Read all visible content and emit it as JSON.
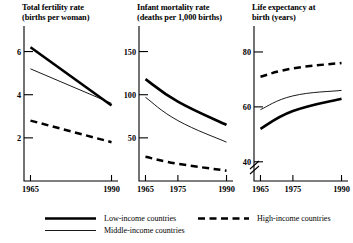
{
  "chart_data": [
    {
      "type": "line",
      "title": "Total fertility rate\n(births per woman)",
      "xlabel": "",
      "ylabel": "",
      "x": [
        1965,
        1990
      ],
      "xticks": [
        "1965",
        "1990"
      ],
      "xtick_values": [
        1965,
        1990
      ],
      "xlim": [
        1963,
        1992
      ],
      "yticks": [
        "2",
        "4",
        "6"
      ],
      "ytick_values": [
        2,
        4,
        6
      ],
      "ylim": [
        0,
        7
      ],
      "grid": false,
      "axis_break": false,
      "series": [
        {
          "name": "Low-income countries",
          "style": "thick-solid",
          "x": [
            1965,
            1990
          ],
          "values": [
            6.2,
            3.5
          ]
        },
        {
          "name": "Middle-income countries",
          "style": "thin-solid",
          "x": [
            1965,
            1990
          ],
          "values": [
            5.2,
            3.6
          ]
        },
        {
          "name": "High-income countries",
          "style": "dashed",
          "x": [
            1965,
            1990
          ],
          "values": [
            2.8,
            1.8
          ]
        }
      ]
    },
    {
      "type": "line",
      "title": "Infant mortality rate\n(deaths per 1,000  births)",
      "xlabel": "",
      "ylabel": "",
      "x": [
        1965,
        1975,
        1990
      ],
      "xticks": [
        "1965",
        "1975",
        "1990"
      ],
      "xtick_values": [
        1965,
        1975,
        1990
      ],
      "xlim": [
        1963,
        1992
      ],
      "yticks": [
        "50",
        "100",
        "150"
      ],
      "ytick_values": [
        50,
        100,
        150
      ],
      "ylim": [
        0,
        175
      ],
      "grid": false,
      "axis_break": false,
      "series": [
        {
          "name": "Low-income countries",
          "style": "thick-solid",
          "x": [
            1965,
            1975,
            1990
          ],
          "values": [
            118,
            92,
            65
          ]
        },
        {
          "name": "Middle-income countries",
          "style": "thin-solid",
          "x": [
            1965,
            1975,
            1990
          ],
          "values": [
            97,
            70,
            45
          ]
        },
        {
          "name": "High-income countries",
          "style": "dashed",
          "x": [
            1965,
            1975,
            1990
          ],
          "values": [
            28,
            20,
            12
          ]
        }
      ]
    },
    {
      "type": "line",
      "title": "Life expectancy at\nbirth (years)",
      "xlabel": "",
      "ylabel": "",
      "x": [
        1965,
        1975,
        1990
      ],
      "xticks": [
        "1965",
        "1975",
        "1990"
      ],
      "xtick_values": [
        1965,
        1975,
        1990
      ],
      "xlim": [
        1963,
        1992
      ],
      "yticks": [
        "40",
        "60",
        "80"
      ],
      "ytick_values": [
        40,
        60,
        80
      ],
      "ylim": [
        33,
        88
      ],
      "grid": false,
      "axis_break": true,
      "series": [
        {
          "name": "Low-income countries",
          "style": "thick-solid",
          "x": [
            1965,
            1975,
            1990
          ],
          "values": [
            52,
            58.5,
            63
          ]
        },
        {
          "name": "Middle-income countries",
          "style": "thin-solid",
          "x": [
            1965,
            1975,
            1990
          ],
          "values": [
            59,
            64,
            66
          ]
        },
        {
          "name": "High-income countries",
          "style": "dashed",
          "x": [
            1965,
            1975,
            1990
          ],
          "values": [
            71,
            74,
            76
          ]
        }
      ]
    }
  ],
  "legend": {
    "position": "bottom",
    "entries": [
      {
        "label": "Low-income countries",
        "style": "thick-solid"
      },
      {
        "label": "Middle-income countries",
        "style": "thin-solid"
      },
      {
        "label": "High-income countries",
        "style": "dashed"
      }
    ]
  }
}
